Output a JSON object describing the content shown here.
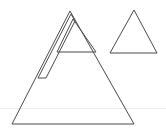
{
  "canvas": {
    "width": 166,
    "height": 135,
    "background_color": "#ffffff",
    "stroke_color": "#4a4a4a",
    "guide_color": "#ededed",
    "stroke_width": 1
  },
  "chart_data": {
    "type": "line",
    "title": "",
    "xlabel": "",
    "ylabel": "",
    "xlim": [
      0,
      166
    ],
    "ylim": [
      0,
      135
    ],
    "grid": false,
    "legend": "none"
  },
  "shapes": {
    "large_triangle": {
      "name": "large-triangle",
      "apex": {
        "x": 70,
        "y": 11
      },
      "bottom_left": {
        "x": 12,
        "y": 124
      },
      "bottom_right": {
        "x": 134,
        "y": 124
      },
      "points": "70,11 12,124 134,124"
    },
    "inner_triangle": {
      "name": "inner-triangle",
      "apex": {
        "x": 73,
        "y": 19
      },
      "base_left": {
        "x": 57,
        "y": 52
      },
      "base_right": {
        "x": 96,
        "y": 52
      },
      "points": "73,19 57,52 96,52"
    },
    "inner_base_line": {
      "name": "inner-base-line",
      "start": {
        "x": 57,
        "y": 52
      },
      "end": {
        "x": 96,
        "y": 52
      }
    },
    "left_sliver": {
      "name": "left-sliver-strip",
      "top": {
        "x": 71,
        "y": 14
      },
      "outer_bottom": {
        "x": 38,
        "y": 78
      },
      "inner_bottom": {
        "x": 46,
        "y": 78
      },
      "inner_top": {
        "x": 75,
        "y": 21
      },
      "points": "71,14 38,78 46,78 75,21"
    },
    "sliver_foot_line": {
      "name": "sliver-foot-line",
      "start": {
        "x": 38,
        "y": 78
      },
      "end": {
        "x": 46,
        "y": 78
      }
    },
    "small_triangle": {
      "name": "small-triangle",
      "apex": {
        "x": 134,
        "y": 10
      },
      "bottom_left": {
        "x": 110,
        "y": 53
      },
      "bottom_right": {
        "x": 157,
        "y": 53
      },
      "points": "134,10 110,53 157,53"
    },
    "horizon_guide": {
      "name": "horizon-guide-line",
      "start": {
        "x": 0,
        "y": 108
      },
      "end": {
        "x": 166,
        "y": 108
      }
    }
  }
}
